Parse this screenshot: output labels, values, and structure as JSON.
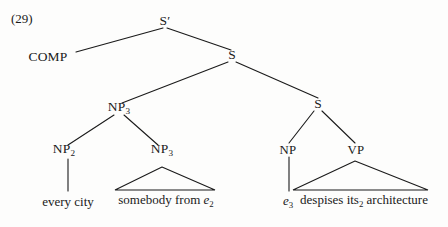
{
  "figure": {
    "example_number": "(29)",
    "background_color": "#fdfdfc",
    "ink_color": "#1a1a1a"
  },
  "nodes": {
    "s_bar": "S′",
    "comp": "COMP",
    "s_main": "S",
    "np_upper": "NP",
    "np_upper_sub": "3",
    "np_left": "NP",
    "np_left_sub": "2",
    "np_right": "NP",
    "np_right_sub": "3",
    "s_embedded": "S",
    "np_subject": "NP",
    "vp": "VP"
  },
  "terminals": {
    "every_city": "every city",
    "somebody_from": "somebody from ",
    "somebody_from_trace": "e",
    "somebody_from_trace_sub": "2",
    "trace_subject": "e",
    "trace_subject_sub": "3",
    "predicate_before": "despises its",
    "predicate_sub": "2",
    "predicate_after": " architecture"
  },
  "tree_structure": {
    "type": "syntax-tree",
    "root": "S′",
    "description": "Phrase structure tree with quantifier raising; triangles abbreviate internal structure."
  }
}
